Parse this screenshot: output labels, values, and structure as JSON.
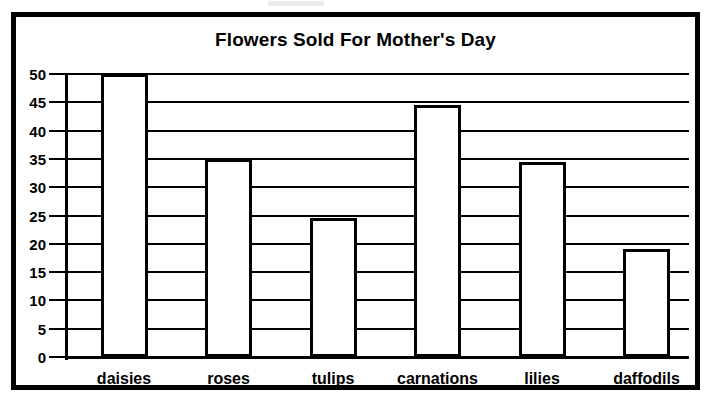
{
  "chart_data": {
    "type": "bar",
    "title": "Flowers Sold For Mother's Day",
    "xlabel": "",
    "ylabel": "",
    "categories": [
      "daisies",
      "roses",
      "tulips",
      "carnations",
      "lilies",
      "daffodils"
    ],
    "values": [
      50,
      35,
      24.5,
      44.5,
      34.5,
      19
    ],
    "ylim": [
      0,
      50
    ],
    "yticks": [
      0,
      5,
      10,
      15,
      20,
      25,
      30,
      35,
      40,
      45,
      50
    ],
    "ytick_labels": [
      "0",
      "5",
      "10",
      "15",
      "20",
      "25",
      "30",
      "35",
      "40",
      "45",
      "50"
    ],
    "grid": true,
    "grid_axis": "y",
    "legend": false,
    "bar_fill_color": "#ffffff",
    "bar_edge_color": "#000000",
    "text_color": "#000000",
    "background_color": "#ffffff"
  }
}
